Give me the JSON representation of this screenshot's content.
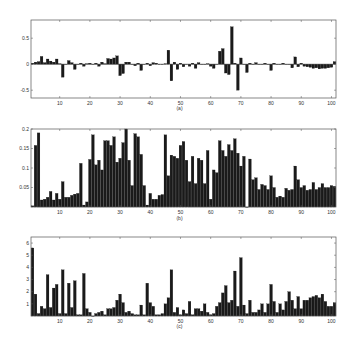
{
  "chart_data": [
    {
      "type": "bar",
      "panel_label": "(a)",
      "xlabel": "",
      "ylabel": "",
      "xlim": [
        1,
        101
      ],
      "ylim": [
        -0.65,
        0.85
      ],
      "xticks": [
        10,
        20,
        30,
        40,
        50,
        60,
        70,
        80,
        90,
        100
      ],
      "yticks": [
        -0.5,
        0,
        0.5
      ],
      "ytick_labels": [
        "-0.5",
        "0",
        "0.5"
      ],
      "grid": false,
      "x": "1..101",
      "values": [
        0.02,
        0.04,
        0.05,
        0.15,
        0.03,
        0.1,
        0.06,
        0.04,
        0.1,
        0.01,
        -0.25,
        0.0,
        0.07,
        0.03,
        -0.1,
        0.0,
        0.02,
        -0.04,
        0.01,
        0.02,
        0.0,
        0.02,
        -0.04,
        0.04,
        0.01,
        0.11,
        0.1,
        0.12,
        0.16,
        -0.22,
        -0.18,
        0.04,
        0.04,
        0.0,
        -0.03,
        0.02,
        -0.12,
        0.0,
        0.02,
        -0.03,
        0.03,
        0.02,
        0.0,
        0.0,
        0.01,
        0.27,
        -0.32,
        0.04,
        -0.1,
        0.02,
        -0.05,
        0.0,
        -0.04,
        0.02,
        -0.08,
        0.03,
        0.0,
        0.0,
        0.01,
        -0.04,
        -0.08,
        0.0,
        0.25,
        0.3,
        -0.17,
        -0.2,
        0.72,
        0.02,
        -0.5,
        0.12,
        0.0,
        -0.16,
        0.02,
        0.0,
        0.03,
        0.0,
        0.0,
        0.02,
        0.0,
        -0.12,
        0.02,
        0.0,
        0.0,
        0.02,
        0.0,
        0.0,
        -0.07,
        0.14,
        -0.05,
        0.02,
        -0.04,
        -0.05,
        -0.06,
        -0.08,
        -0.07,
        -0.09,
        -0.08,
        -0.08,
        -0.07,
        -0.06,
        0.05
      ]
    },
    {
      "type": "bar",
      "panel_label": "(b)",
      "xlabel": "",
      "ylabel": "",
      "xlim": [
        1,
        101
      ],
      "ylim": [
        0,
        0.2
      ],
      "xticks": [
        10,
        20,
        30,
        40,
        50,
        60,
        70,
        80,
        90,
        100
      ],
      "yticks": [
        0.05,
        0.1,
        0.15,
        0.2
      ],
      "ytick_labels": [
        "0.05",
        "0.1",
        "0.15",
        "0.2"
      ],
      "grid": false,
      "x": "1..101",
      "values": [
        0.003,
        0.158,
        0.19,
        0.018,
        0.02,
        0.025,
        0.04,
        0.018,
        0.035,
        0.02,
        0.065,
        0.025,
        0.025,
        0.03,
        0.033,
        0.035,
        0.112,
        0.005,
        0.013,
        0.122,
        0.185,
        0.108,
        0.12,
        0.095,
        0.17,
        0.17,
        0.158,
        0.18,
        0.115,
        0.125,
        0.165,
        0.2,
        0.12,
        0.055,
        0.188,
        0.18,
        0.135,
        0.055,
        0.005,
        0.035,
        0.02,
        0.02,
        0.03,
        0.032,
        0.185,
        0.08,
        0.133,
        0.13,
        0.125,
        0.158,
        0.168,
        0.12,
        0.065,
        0.13,
        0.06,
        0.125,
        0.12,
        0.06,
        0.145,
        0.02,
        0.095,
        0.088,
        0.17,
        0.145,
        0.13,
        0.16,
        0.145,
        0.175,
        0.138,
        0.105,
        0.13,
        0.0,
        0.123,
        0.07,
        0.075,
        0.045,
        0.058,
        0.055,
        0.045,
        0.08,
        0.05,
        0.025,
        0.028,
        0.025,
        0.048,
        0.043,
        0.045,
        0.105,
        0.07,
        0.05,
        0.055,
        0.043,
        0.045,
        0.063,
        0.045,
        0.05,
        0.06,
        0.05,
        0.05,
        0.055,
        0.053
      ]
    },
    {
      "type": "bar",
      "panel_label": "(c)",
      "xlabel": "",
      "ylabel": "",
      "xlim": [
        1,
        101
      ],
      "ylim": [
        0,
        6.5
      ],
      "xticks": [
        10,
        20,
        30,
        40,
        50,
        60,
        70,
        80,
        90,
        100
      ],
      "yticks": [
        1,
        2,
        3,
        4,
        5,
        6
      ],
      "ytick_labels": [
        "1",
        "2",
        "3",
        "4",
        "5",
        "6"
      ],
      "grid": false,
      "x": "1..101",
      "values": [
        5.6,
        1.8,
        0.2,
        0.8,
        0.6,
        3.4,
        0.7,
        2.3,
        2.6,
        0.2,
        3.8,
        0.2,
        2.7,
        0.7,
        2.9,
        0.1,
        0.1,
        3.5,
        0.6,
        0.3,
        0.0,
        0.2,
        0.3,
        0.4,
        0.1,
        0.6,
        0.6,
        0.7,
        1.3,
        1.8,
        1.1,
        0.3,
        0.4,
        0.2,
        0.1,
        0.1,
        0.9,
        0.1,
        2.7,
        1.1,
        0.8,
        0.1,
        0.1,
        0.2,
        1.0,
        1.5,
        3.8,
        0.3,
        0.7,
        0.1,
        0.5,
        0.2,
        1.2,
        0.1,
        0.6,
        0.6,
        0.4,
        1.0,
        0.3,
        0.1,
        0.2,
        0.8,
        1.1,
        1.9,
        2.5,
        1.1,
        1.3,
        3.7,
        0.8,
        4.8,
        0.9,
        0.2,
        1.3,
        0.3,
        0.3,
        0.5,
        1.0,
        0.3,
        1.0,
        2.6,
        1.2,
        0.3,
        1.0,
        0.5,
        1.2,
        2.0,
        1.3,
        0.6,
        1.6,
        0.6,
        1.3,
        1.3,
        1.5,
        1.6,
        1.7,
        1.5,
        1.8,
        1.2,
        0.8,
        0.8,
        1.1
      ]
    }
  ],
  "panels": [
    {
      "label": "(a)"
    },
    {
      "label": "(b)"
    },
    {
      "label": "(c)"
    }
  ]
}
